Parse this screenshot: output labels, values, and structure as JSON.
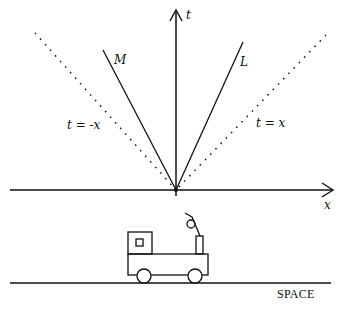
{
  "diagram": {
    "axes": {
      "t_label": "t",
      "x_label": "x"
    },
    "worldlines": [
      {
        "id": "M",
        "label": "M"
      },
      {
        "id": "L",
        "label": "L"
      }
    ],
    "light_lines": [
      {
        "id": "left",
        "label": "t = -x"
      },
      {
        "id": "right",
        "label": "t = x"
      }
    ],
    "ground_label": "SPACE",
    "colors": {
      "ink": "#111111",
      "background": "#ffffff"
    }
  }
}
